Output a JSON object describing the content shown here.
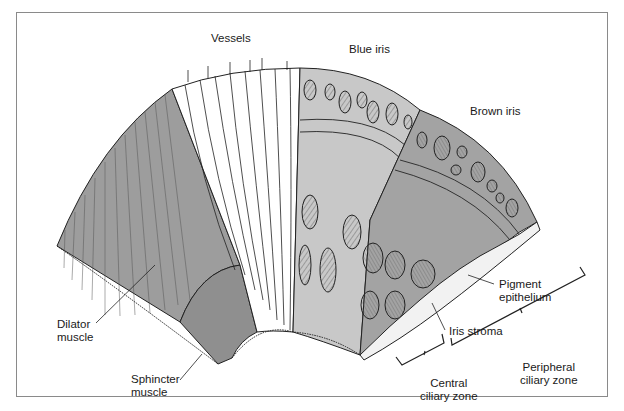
{
  "figure": {
    "type": "anatomical illustration",
    "labels": {
      "vessels": "Vessels",
      "blue_iris": "Blue iris",
      "brown_iris": "Brown iris",
      "pigment_epithelium_1": "Pigment",
      "pigment_epithelium_2": "epithelium",
      "iris_stroma": "Iris stroma",
      "dilator_1": "Dilator",
      "dilator_2": "muscle",
      "sphincter_1": "Sphincter",
      "sphincter_2": "muscle",
      "peripheral_1": "Peripheral",
      "peripheral_2": "ciliary zone",
      "central_1": "Central",
      "central_2": "ciliary zone"
    },
    "colors": {
      "tissue_gray": "#9a9a9a",
      "tissue_light": "#c4c4c4",
      "line": "#1a1a1a",
      "white": "#ffffff",
      "frame": "#8a8a8a"
    }
  }
}
